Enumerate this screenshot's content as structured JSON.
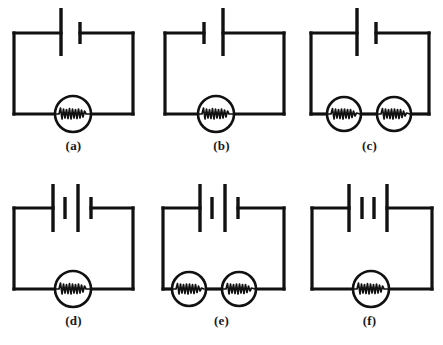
{
  "figure": {
    "background_color": "#ffffff",
    "line_color": "#111111",
    "columns": 3,
    "rows": 2
  },
  "circuits": [
    {
      "id": "a",
      "label": "(a)",
      "battery": {
        "cells": 1,
        "plates": [
          "long",
          "short"
        ],
        "description": "one cell, positive terminal on left"
      },
      "bulbs": 1,
      "bulb_symbol": "lamp-filament-circle",
      "topology": "series"
    },
    {
      "id": "b",
      "label": "(b)",
      "battery": {
        "cells": 1,
        "plates": [
          "short",
          "long"
        ],
        "description": "one cell, reversed polarity"
      },
      "bulbs": 1,
      "bulb_symbol": "lamp-filament-circle",
      "topology": "series"
    },
    {
      "id": "c",
      "label": "(c)",
      "battery": {
        "cells": 1,
        "plates": [
          "long",
          "short"
        ],
        "description": "one cell, positive terminal on left"
      },
      "bulbs": 2,
      "bulb_symbol": "lamp-filament-circle",
      "topology": "series"
    },
    {
      "id": "d",
      "label": "(d)",
      "battery": {
        "cells": 2,
        "plates": [
          "long",
          "short",
          "long",
          "short"
        ],
        "description": "two cells in series"
      },
      "bulbs": 1,
      "bulb_symbol": "lamp-filament-circle",
      "topology": "series"
    },
    {
      "id": "e",
      "label": "(e)",
      "battery": {
        "cells": 2,
        "plates": [
          "long",
          "short",
          "long",
          "short"
        ],
        "description": "two cells in series"
      },
      "bulbs": 2,
      "bulb_symbol": "lamp-filament-circle",
      "topology": "series"
    },
    {
      "id": "f",
      "label": "(f)",
      "battery": {
        "cells": 2,
        "plates": [
          "long",
          "short",
          "short",
          "long"
        ],
        "description": "two cells with opposing polarity"
      },
      "bulbs": 1,
      "bulb_symbol": "lamp-filament-circle",
      "topology": "series"
    }
  ]
}
